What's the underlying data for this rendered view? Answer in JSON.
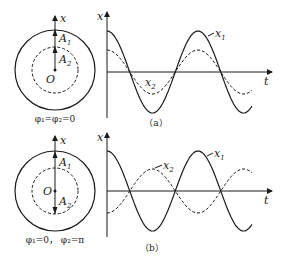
{
  "figure": {
    "panel_a": {
      "caption": "（a）",
      "phasor": {
        "axis_label": "x",
        "a1_label": "A",
        "a1_sub": "1",
        "a2_label": "A",
        "a2_sub": "2",
        "origin_label": "O",
        "phase_label": "φ₁=φ₂=0"
      },
      "graph": {
        "y_label": "x",
        "t_label": "t",
        "x1_label": "x",
        "x1_sub": "1",
        "x2_label": "x",
        "x2_sub": "2"
      }
    },
    "panel_b": {
      "caption": "（b）",
      "phasor": {
        "axis_label": "x",
        "a1_label": "A",
        "a1_sub": "1",
        "a2_label": "A",
        "a2_sub": "2",
        "origin_label": "O",
        "phase_label": "φ₁=0， φ₂=π"
      },
      "graph": {
        "y_label": "x",
        "t_label": "t",
        "x1_label": "x",
        "x1_sub": "1",
        "x2_label": "x",
        "x2_sub": "2"
      }
    }
  },
  "curves": {
    "a": {
      "x1": {
        "amplitude": 41,
        "phase": 0,
        "style": "solid"
      },
      "x2": {
        "amplitude": 22,
        "phase": 0,
        "style": "dashed"
      }
    },
    "b": {
      "x1": {
        "amplitude": 40,
        "phase": 0,
        "style": "solid"
      },
      "x2": {
        "amplitude": 22,
        "phase": "π",
        "style": "dashed"
      }
    }
  }
}
